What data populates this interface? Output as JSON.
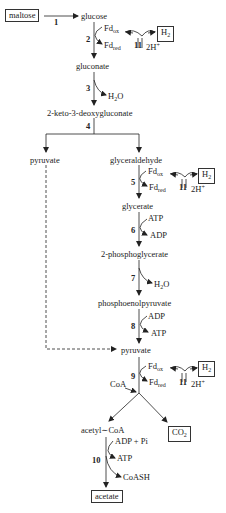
{
  "metabolites": {
    "maltose": "maltose",
    "glucose": "glucose",
    "gluconate": "gluconate",
    "kdg": "2-keto-3-deoxygluconate",
    "pyruvate_left": "pyruvate",
    "glyceraldehyde": "glyceraldehyde",
    "glycerate": "glycerate",
    "phosphoglycerate": "2-phosphoglycerate",
    "pep": "phosphoenolpyruvate",
    "pyruvate": "pyruvate",
    "acetyl_coa": "acetyl∼CoA",
    "co2": "CO",
    "co2_sub": "2",
    "acetate": "acetate"
  },
  "steps": [
    "1",
    "2",
    "3",
    "4",
    "5",
    "6",
    "7",
    "8",
    "9",
    "10",
    "11"
  ],
  "cofactors": {
    "fd": "Fd",
    "ox": "ox",
    "red": "red",
    "h2": "H",
    "h2_sub": "2",
    "protons": "2H",
    "protons_sup": "+",
    "water": "H",
    "water_sub": "2",
    "water_o": "O",
    "atp": "ATP",
    "adp": "ADP",
    "adp_pi": "ADP + Pi",
    "coa": "CoA",
    "coash": "CoASH"
  }
}
